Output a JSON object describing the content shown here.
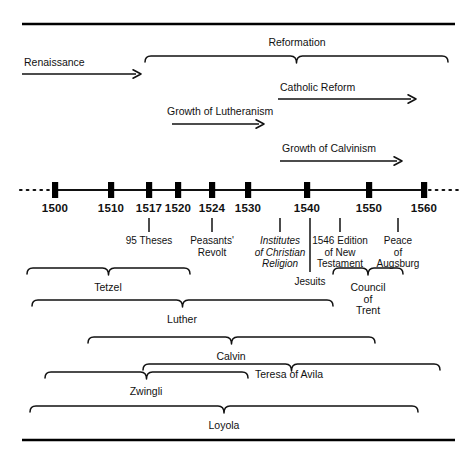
{
  "figure": {
    "type": "timeline-diagram",
    "colors": {
      "ink": "#111111",
      "rule": "#000000",
      "background": "#ffffff"
    }
  },
  "axis": {
    "label": "timeline-axis",
    "continues_left": true,
    "continues_right": true,
    "ticks": [
      {
        "year": "1500",
        "x": 55
      },
      {
        "year": "1510",
        "x": 111
      },
      {
        "year": "1517",
        "x": 149
      },
      {
        "year": "1520",
        "x": 178
      },
      {
        "year": "1524",
        "x": 212
      },
      {
        "year": "1530",
        "x": 248
      },
      {
        "year": "1540",
        "x": 307
      },
      {
        "year": "1550",
        "x": 369
      },
      {
        "year": "1560",
        "x": 424
      }
    ]
  },
  "eras": [
    {
      "id": "renaissance",
      "label": "Renaissance",
      "kind": "arrow",
      "x1": 22,
      "x2": 141,
      "y": 74,
      "label_x": 24,
      "label_y": 66,
      "label_anchor": "start"
    },
    {
      "id": "reformation",
      "label": "Reformation",
      "kind": "brace",
      "x1": 145,
      "x2": 448,
      "y": 56,
      "label_x": 297,
      "label_y": 46,
      "label_anchor": "middle"
    },
    {
      "id": "catholic-reform",
      "label": "Catholic Reform",
      "kind": "arrow",
      "x1": 278,
      "x2": 416,
      "y": 99,
      "label_x": 280,
      "label_y": 91,
      "label_anchor": "start"
    },
    {
      "id": "growth-of-lutheranism",
      "label": "Growth of Lutheranism",
      "kind": "arrow",
      "x1": 172,
      "x2": 264,
      "y": 124,
      "label_x": 167,
      "label_y": 115,
      "label_anchor": "start"
    },
    {
      "id": "growth-of-calvinism",
      "label": "Growth of Calvinism",
      "kind": "arrow",
      "x1": 280,
      "x2": 402,
      "y": 161,
      "label_x": 282,
      "label_y": 152,
      "label_anchor": "start"
    }
  ],
  "events": [
    {
      "id": "95-theses",
      "lines": [
        "95 Theses"
      ],
      "italic": false,
      "leader_x": 149,
      "leader_y1": 218,
      "leader_y2": 232,
      "label_x": 149,
      "label_y": 244
    },
    {
      "id": "peasants-revolt",
      "lines": [
        "Peasants'",
        "Revolt"
      ],
      "italic": false,
      "leader_x": 212,
      "leader_y1": 218,
      "leader_y2": 232,
      "label_x": 212,
      "label_y": 244
    },
    {
      "id": "institutes-of-christian-religion",
      "lines": [
        "Institutes",
        "of Christian",
        "Religion"
      ],
      "italic": true,
      "leader_x": 280,
      "leader_y1": 218,
      "leader_y2": 232,
      "label_x": 280,
      "label_y": 244
    },
    {
      "id": "jesuits",
      "lines": [
        "Jesuits"
      ],
      "italic": false,
      "leader_x": 310,
      "leader_y1": 218,
      "leader_y2": 272,
      "label_x": 310,
      "label_y": 285
    },
    {
      "id": "1546-edition-of-new-testament",
      "lines": [
        "1546 Edition",
        "of New",
        "Testament"
      ],
      "italic": false,
      "leader_x": 340,
      "leader_y1": 218,
      "leader_y2": 232,
      "label_x": 340,
      "label_y": 244
    },
    {
      "id": "peace-of-augsburg",
      "lines": [
        "Peace",
        "of",
        "Augsburg"
      ],
      "italic": false,
      "leader_x": 398,
      "leader_y1": 218,
      "leader_y2": 232,
      "label_x": 398,
      "label_y": 244
    }
  ],
  "people": [
    {
      "id": "tetzel",
      "label": "Tetzel",
      "x1": 27,
      "x2": 190,
      "y": 268,
      "label_x": 108,
      "label_y": 291,
      "label_anchor": "middle"
    },
    {
      "id": "council-of-trent",
      "label_lines": [
        "Council",
        "of",
        "Trent"
      ],
      "label": "Council of Trent",
      "x1": 333,
      "x2": 403,
      "y": 268,
      "label_x": 368,
      "label_y": 291,
      "label_anchor": "middle"
    },
    {
      "id": "luther",
      "label": "Luther",
      "x1": 32,
      "x2": 333,
      "y": 300,
      "label_x": 182,
      "label_y": 323,
      "label_anchor": "middle"
    },
    {
      "id": "calvin",
      "label": "Calvin",
      "x1": 88,
      "x2": 375,
      "y": 337,
      "label_x": 231,
      "label_y": 360,
      "label_anchor": "middle"
    },
    {
      "id": "teresa-of-avila",
      "label": "Teresa of Avila",
      "x1": 143,
      "x2": 440,
      "y": 364,
      "label_x": 255,
      "label_y": 378,
      "label_anchor": "start"
    },
    {
      "id": "zwingli",
      "label": "Zwingli",
      "x1": 45,
      "x2": 248,
      "y": 372,
      "label_x": 146,
      "label_y": 395,
      "label_anchor": "middle"
    },
    {
      "id": "loyola",
      "label": "Loyola",
      "x1": 30,
      "x2": 418,
      "y": 406,
      "label_x": 224,
      "label_y": 429,
      "label_anchor": "middle"
    }
  ],
  "rules": [
    {
      "id": "top-rule",
      "x1": 22,
      "x2": 455,
      "y": 24
    },
    {
      "id": "bottom-rule",
      "x1": 22,
      "x2": 455,
      "y": 440
    }
  ]
}
